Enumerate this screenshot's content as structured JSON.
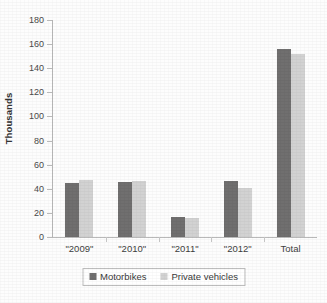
{
  "chart_data": {
    "type": "bar",
    "title": "",
    "subtitle": "",
    "xlabel": "",
    "ylabel": "Thousands",
    "categories": [
      "\"2009\"",
      "\"2010\"",
      "\"2011\"",
      "\"2012\"",
      "Total"
    ],
    "series": [
      {
        "name": "Motorbikes",
        "color": "#706f6f",
        "values": [
          45,
          46,
          17,
          46.5,
          156
        ]
      },
      {
        "name": "Private vehicles",
        "color": "#d2d2d2",
        "values": [
          47,
          46.5,
          15.5,
          41,
          152
        ]
      }
    ],
    "ylim": [
      0,
      180
    ],
    "ytick_step": 20,
    "ytick_labels": [
      "0",
      "20",
      "40",
      "60",
      "80",
      "100",
      "120",
      "140",
      "160",
      "180"
    ],
    "grid": false,
    "tick_marks": true,
    "legend_position": "bottom",
    "legend_border": true,
    "axis_color": "#b9b9b9",
    "background_color": "#fdfdfd"
  }
}
